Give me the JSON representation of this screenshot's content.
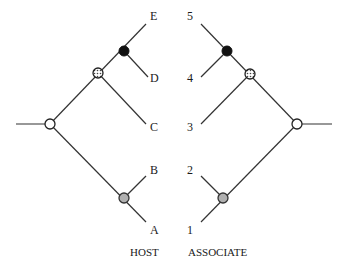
{
  "diagram": {
    "type": "cophylogeny",
    "host": {
      "caption": "HOST",
      "tips": [
        "E",
        "D",
        "C",
        "B",
        "A"
      ]
    },
    "associate": {
      "caption": "ASSOCIATE",
      "tips": [
        "5",
        "4",
        "3",
        "2",
        "1"
      ]
    },
    "node_styles": {
      "root": {
        "fill": "#ffffff",
        "stroke": "#222222",
        "pattern": "open"
      },
      "inner_gray": {
        "fill": "#b0b0b0",
        "stroke": "#333333",
        "pattern": "gray"
      },
      "dotted": {
        "fill": "#ffffff",
        "stroke": "#222222",
        "pattern": "stippled"
      },
      "black": {
        "fill": "#111111",
        "stroke": "#111111",
        "pattern": "solid"
      }
    },
    "colors": {
      "line": "#333333",
      "text": "#1a1a1a",
      "background": "#ffffff"
    }
  }
}
